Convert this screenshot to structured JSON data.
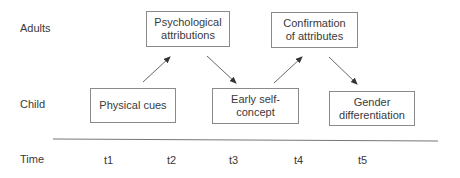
{
  "rows": {
    "adults": "Adults",
    "child": "Child",
    "time": "Time"
  },
  "boxes": {
    "psychological_attributions": "Psychological attributions",
    "confirmation_of_attributes": "Confirmation of attributes",
    "physical_cues": "Physical cues",
    "early_self_concept": "Early self-concept",
    "gender_differentiation": "Gender differentiation"
  },
  "time_points": [
    "t1",
    "t2",
    "t3",
    "t4",
    "t5"
  ],
  "colors": {
    "line": "#555555",
    "box_border": "#8a8a8a",
    "text": "#3a3a3a"
  }
}
